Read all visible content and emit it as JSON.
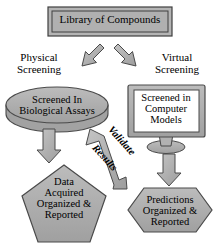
{
  "diagram": {
    "colors": {
      "shape_fill": "#a8a8a8",
      "shape_fill_light": "#bdbdbd",
      "shape_stroke": "#4a4a4a",
      "arrow_fill": "#b0b0b0",
      "arrow_stroke": "#4a4a4a",
      "screen_fill": "#ffffff",
      "text": "#000000",
      "background": "#ffffff"
    },
    "nodes": {
      "library": {
        "label": "Library of Compounds",
        "shape": "beveled-rectangle"
      },
      "biological_assays": {
        "label": "Screened In Biological Assays",
        "line1": "Screened In",
        "line2": "Biological Assays",
        "shape": "cylinder"
      },
      "computer_models": {
        "label": "Screened in Computer Models",
        "line1": "Screened in",
        "line2": "Computer",
        "line3": "Models",
        "shape": "monitor"
      },
      "data_reported": {
        "label": "Data Acquired Organized & Reported",
        "line1": "Data",
        "line2": "Acquired",
        "line3": "Organized &",
        "line4": "Reported",
        "shape": "pentagon"
      },
      "predictions_reported": {
        "label": "Predictions Organized & Reported",
        "line1": "Predictions",
        "line2": "Organized &",
        "line3": "Reported",
        "shape": "hexagon"
      }
    },
    "edges": {
      "physical_branch": {
        "label": "Physical Screening",
        "line1": "Physical",
        "line2": "Screening",
        "direction": "down-left"
      },
      "virtual_branch": {
        "label": "Virtual Screening",
        "line1": "Virtual",
        "line2": "Screening",
        "direction": "down-right"
      },
      "assays_to_data": {
        "label": "",
        "direction": "down"
      },
      "models_to_predictions": {
        "label": "",
        "direction": "down"
      },
      "feedback": {
        "label": "Validate Results",
        "word1": "Validate",
        "word2": "Results",
        "direction": "up-left"
      }
    }
  }
}
